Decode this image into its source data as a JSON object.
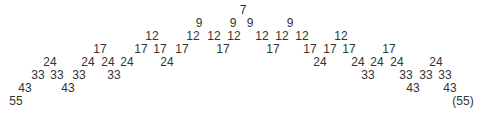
{
  "diagram": {
    "type": "number-pyramid",
    "nodes": [
      {
        "label": "7",
        "x": 243,
        "y": 4
      },
      {
        "label": "9",
        "x": 199,
        "y": 17
      },
      {
        "label": "9",
        "x": 233,
        "y": 17
      },
      {
        "label": "9",
        "x": 250,
        "y": 17
      },
      {
        "label": "9",
        "x": 290,
        "y": 17
      },
      {
        "label": "12",
        "x": 152,
        "y": 30
      },
      {
        "label": "12",
        "x": 193,
        "y": 30
      },
      {
        "label": "12",
        "x": 214,
        "y": 30
      },
      {
        "label": "12",
        "x": 234,
        "y": 30
      },
      {
        "label": "12",
        "x": 262,
        "y": 30
      },
      {
        "label": "12",
        "x": 282,
        "y": 30
      },
      {
        "label": "12",
        "x": 302,
        "y": 30
      },
      {
        "label": "12",
        "x": 341,
        "y": 30
      },
      {
        "label": "17",
        "x": 100,
        "y": 43
      },
      {
        "label": "17",
        "x": 141,
        "y": 43
      },
      {
        "label": "17",
        "x": 160,
        "y": 43
      },
      {
        "label": "17",
        "x": 182,
        "y": 43
      },
      {
        "label": "17",
        "x": 223,
        "y": 43
      },
      {
        "label": "17",
        "x": 273,
        "y": 43
      },
      {
        "label": "17",
        "x": 310,
        "y": 43
      },
      {
        "label": "17",
        "x": 330,
        "y": 43
      },
      {
        "label": "17",
        "x": 349,
        "y": 43
      },
      {
        "label": "17",
        "x": 389,
        "y": 43
      },
      {
        "label": "24",
        "x": 50,
        "y": 56
      },
      {
        "label": "24",
        "x": 88,
        "y": 56
      },
      {
        "label": "24",
        "x": 108,
        "y": 56
      },
      {
        "label": "24",
        "x": 127,
        "y": 56
      },
      {
        "label": "24",
        "x": 167,
        "y": 56
      },
      {
        "label": "24",
        "x": 320,
        "y": 56
      },
      {
        "label": "24",
        "x": 358,
        "y": 56
      },
      {
        "label": "24",
        "x": 377,
        "y": 56
      },
      {
        "label": "24",
        "x": 397,
        "y": 56
      },
      {
        "label": "24",
        "x": 436,
        "y": 56
      },
      {
        "label": "33",
        "x": 38,
        "y": 69
      },
      {
        "label": "33",
        "x": 57,
        "y": 69
      },
      {
        "label": "33",
        "x": 79,
        "y": 69
      },
      {
        "label": "33",
        "x": 114,
        "y": 69
      },
      {
        "label": "33",
        "x": 368,
        "y": 69
      },
      {
        "label": "33",
        "x": 406,
        "y": 69
      },
      {
        "label": "33",
        "x": 426,
        "y": 69
      },
      {
        "label": "33",
        "x": 445,
        "y": 69
      },
      {
        "label": "43",
        "x": 25,
        "y": 82
      },
      {
        "label": "43",
        "x": 68,
        "y": 82
      },
      {
        "label": "43",
        "x": 413,
        "y": 82
      },
      {
        "label": "43",
        "x": 450,
        "y": 82
      },
      {
        "label": "55",
        "x": 16,
        "y": 95
      },
      {
        "label": "(55)",
        "x": 463,
        "y": 95
      }
    ]
  }
}
